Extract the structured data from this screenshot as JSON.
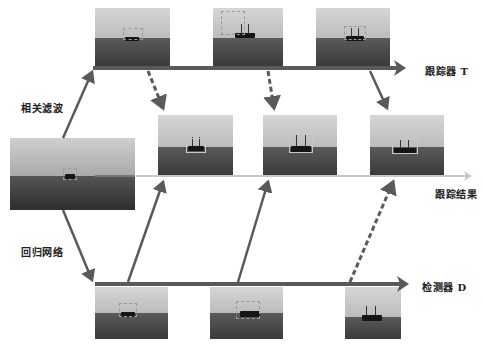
{
  "labels": {
    "correlation_filter": "相关滤波",
    "regression_network": "回归网络",
    "tracker_t": "跟踪器 T",
    "tracking_result": "跟踪结果",
    "detector_d": "检测器 D"
  },
  "colors": {
    "arrow": "#5a5a5a",
    "result_line": "#c8c8c8",
    "sky_top": "#d4d4d4",
    "sky_bottom": "#bdbdbd",
    "sea": "#4a4a4a"
  },
  "nodes": {
    "input_frame": {
      "role": "input-image"
    },
    "tracker_row": [
      {
        "role": "tracker-frame-1"
      },
      {
        "role": "tracker-frame-2"
      },
      {
        "role": "tracker-frame-3"
      }
    ],
    "result_row": [
      {
        "role": "result-frame-1"
      },
      {
        "role": "result-frame-2"
      },
      {
        "role": "result-frame-3"
      }
    ],
    "detector_row": [
      {
        "role": "detector-frame-1"
      },
      {
        "role": "detector-frame-2"
      },
      {
        "role": "detector-frame-3"
      }
    ]
  },
  "edges": [
    {
      "from": "input_frame",
      "to": "tracker_row",
      "style": "solid",
      "label": "相关滤波"
    },
    {
      "from": "input_frame",
      "to": "detector_row",
      "style": "solid",
      "label": "回归网络"
    },
    {
      "from": "tracker_row.0",
      "to": "result_row.0",
      "style": "dashed"
    },
    {
      "from": "tracker_row.1",
      "to": "result_row.1",
      "style": "dashed"
    },
    {
      "from": "tracker_row.2",
      "to": "result_row.2",
      "style": "solid"
    },
    {
      "from": "detector_row.0",
      "to": "result_row.0",
      "style": "solid"
    },
    {
      "from": "detector_row.1",
      "to": "result_row.1",
      "style": "solid"
    },
    {
      "from": "detector_row.2",
      "to": "result_row.2",
      "style": "dashed"
    }
  ]
}
